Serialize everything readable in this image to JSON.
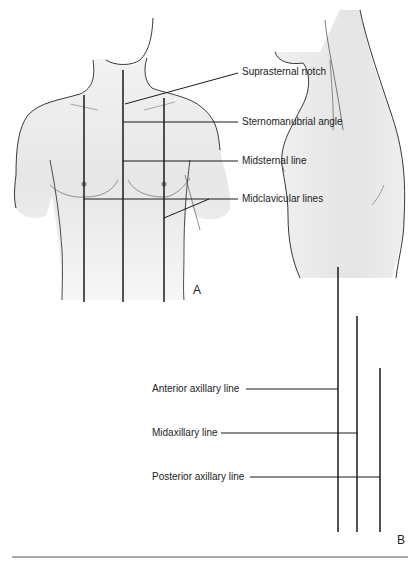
{
  "figure_a": {
    "label": "A",
    "annotations": [
      {
        "id": "suprasternal-notch",
        "text": "Suprasternal notch"
      },
      {
        "id": "sternomanubrial-angle",
        "text": "Sternomanubrial angle"
      },
      {
        "id": "midsternal-line",
        "text": "Midsternal line"
      },
      {
        "id": "midclavicular-lines",
        "text": "Midclavicular lines"
      }
    ]
  },
  "figure_b": {
    "label": "B",
    "annotations": [
      {
        "id": "anterior-axillary-line",
        "text": "Anterior axillary line"
      },
      {
        "id": "midaxillary-line",
        "text": "Midaxillary line"
      },
      {
        "id": "posterior-axillary-line",
        "text": "Posterior axillary line"
      }
    ]
  },
  "colors": {
    "line": "#1a1a1a",
    "skin": "#e9e9e9",
    "background": "#ffffff"
  }
}
